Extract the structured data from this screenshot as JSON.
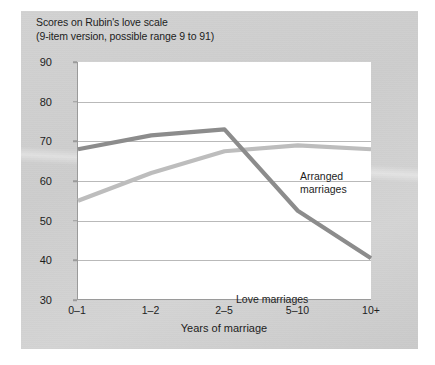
{
  "figure": {
    "title_line1": "Scores on Rubin's love scale",
    "title_line2": "(9-item version, possible range 9 to 91)",
    "panel_color": "#cfcfcf",
    "plot_background": "#ffffff",
    "gridline_color": "#b9b9b9",
    "axis_color": "#9a9a9a"
  },
  "chart_data": {
    "type": "line",
    "title": "Scores on Rubin's love scale (9-item version, possible range 9 to 91)",
    "xlabel": "Years of marriage",
    "ylabel": "",
    "categories": [
      "0–1",
      "1–2",
      "2–5",
      "5–10",
      "10+"
    ],
    "ylim": [
      30,
      90
    ],
    "yticks": [
      30,
      40,
      50,
      60,
      70,
      80,
      90
    ],
    "grid": true,
    "legend": "annotations-inline",
    "series": [
      {
        "name": "Arranged marriages",
        "color": "#bdbdbd",
        "values": [
          55,
          62,
          67.5,
          69,
          68
        ]
      },
      {
        "name": "Love marriages",
        "color": "#8c8c8c",
        "values": [
          68,
          71.5,
          73,
          52.5,
          40.5
        ]
      }
    ],
    "annotations": [
      {
        "text_line1": "Arranged",
        "text_line2": "marriages"
      },
      {
        "text_line1": "Love marriages",
        "text_line2": ""
      }
    ]
  }
}
